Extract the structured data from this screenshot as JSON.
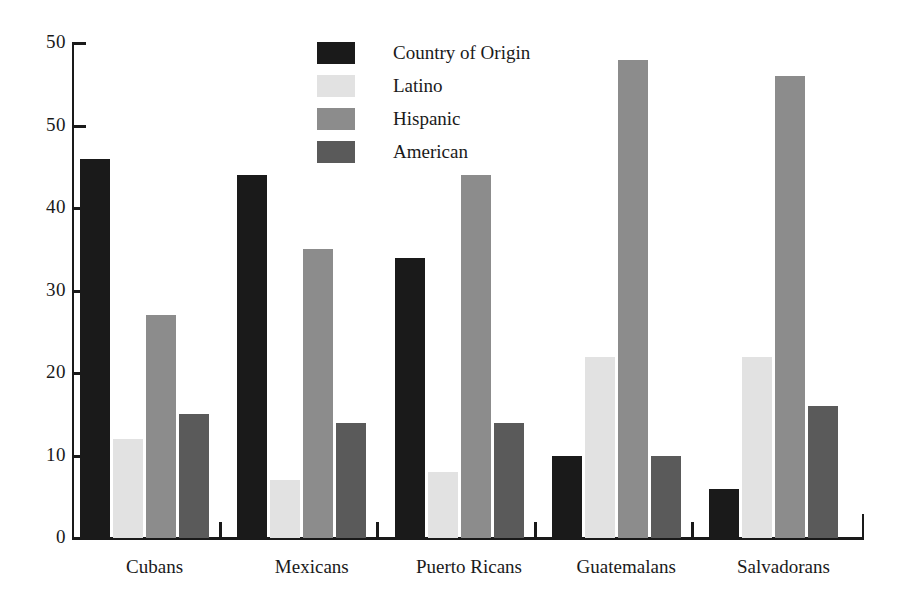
{
  "chart_data": {
    "type": "bar",
    "title": "",
    "subtitle": "",
    "xlabel": "",
    "ylabel": "",
    "ylim": [
      0,
      60
    ],
    "yticks": [
      0,
      10,
      20,
      30,
      40,
      50,
      50
    ],
    "ytick_labels": [
      "0",
      "10",
      "20",
      "30",
      "40",
      "50",
      "50"
    ],
    "grid": false,
    "legend_position": "top-center",
    "categories": [
      "Cubans",
      "Mexicans",
      "Puerto Ricans",
      "Guatemalans",
      "Salvadorans"
    ],
    "series": [
      {
        "name": "Country of Origin",
        "color": "#1a1a1a",
        "values": [
          46,
          44,
          34,
          10,
          6
        ]
      },
      {
        "name": "Latino",
        "color": "#e2e2e2",
        "values": [
          12,
          7,
          8,
          22,
          22
        ]
      },
      {
        "name": "Hispanic",
        "color": "#8c8c8c",
        "values": [
          27,
          35,
          44,
          58,
          56
        ]
      },
      {
        "name": "American",
        "color": "#5a5a5a",
        "values": [
          15,
          14,
          14,
          10,
          16
        ]
      }
    ]
  },
  "axes": {
    "y_tick_labels": [
      "50",
      "50",
      "40",
      "30",
      "20",
      "10",
      "0"
    ],
    "x_group_labels": [
      "Cubans",
      "Mexicans",
      "Puerto Ricans",
      "Guatemalans",
      "Salvadorans"
    ]
  },
  "legend": {
    "items": [
      {
        "label": "Country of Origin",
        "color": "#1a1a1a"
      },
      {
        "label": "Latino",
        "color": "#e2e2e2"
      },
      {
        "label": "Hispanic",
        "color": "#8c8c8c"
      },
      {
        "label": "American",
        "color": "#5a5a5a"
      }
    ]
  }
}
